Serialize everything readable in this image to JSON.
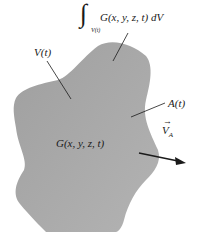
{
  "diagram": {
    "labels": {
      "integral_body": "G(x, y, z, t) dV",
      "integral_symbol": "∫",
      "integral_subscript": "V(t)",
      "volume": "V(t)",
      "surface": "A(t)",
      "field": "G(x, y, z, t)",
      "velocity": "V",
      "velocity_subscript": "A",
      "velocity_arrow": "→"
    },
    "colors": {
      "region_fill": "#a9a9a9",
      "ink": "#1a1a1a",
      "background": "#ffffff"
    }
  }
}
